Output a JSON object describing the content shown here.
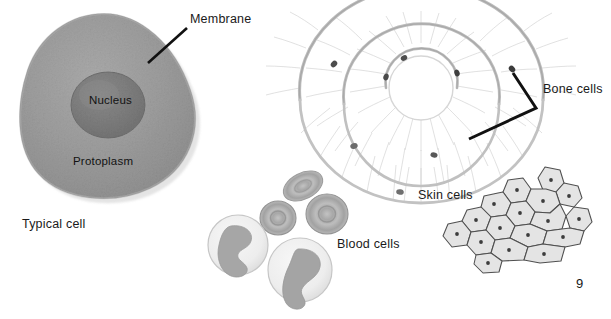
{
  "page": {
    "number": "9",
    "background_color": "#ffffff",
    "top_cut_text": "illustrations of cells"
  },
  "labels": {
    "membrane": "Membrane",
    "nucleus": "Nucleus",
    "protoplasm": "Protoplasm",
    "typical_cell": "Typical cell",
    "bone_cells": "Bone cells",
    "blood_cells": "Blood cells",
    "skin_cells": "Skin cells"
  },
  "colors": {
    "text": "#1a1a1a",
    "leader_line": "#111111",
    "cell_body": "#9a9a9a",
    "cell_body_edge": "#8b8b8b",
    "nucleus": "#7d7d7d",
    "nucleus_edge": "#6e6e6e",
    "bone_lamella": "#b9b9b9",
    "bone_lacuna": "#4a4a4a",
    "canaliculi": "#c9c9c9",
    "red_blood_cell": "#b0b0b0",
    "red_blood_cell_rim": "#9b9b9b",
    "white_blood_cell": "#efefef",
    "white_blood_cell_nucleus": "#a8a8a8",
    "skin_cell_fill": "#e4e4e4",
    "skin_cell_stroke": "#4f4f4f",
    "skin_cell_nucleus": "#3d3d3d"
  },
  "figures": {
    "typical_cell": {
      "name": "typical-cell",
      "parts": [
        "Membrane",
        "Nucleus",
        "Protoplasm"
      ],
      "caption": "Typical cell"
    },
    "bone_cells": {
      "name": "bone-cells",
      "caption": "Bone cells",
      "description": "concentric lamellae around central canal with lacunae and canaliculi",
      "lacunae_count": 8
    },
    "blood_cells": {
      "name": "blood-cells",
      "caption": "Blood cells",
      "red_cell_count": 3,
      "white_cell_count": 2
    },
    "skin_cells": {
      "name": "skin-cells",
      "caption": "Skin cells",
      "cell_count": 17
    }
  }
}
